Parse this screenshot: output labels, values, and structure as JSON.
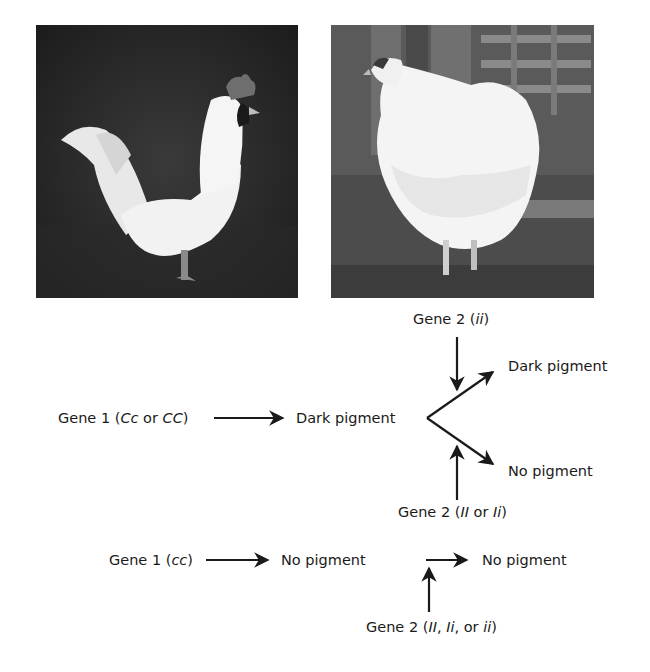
{
  "figure": {
    "photos": [
      {
        "name": "white-rooster",
        "description": "White rooster with red comb standing on dark ground"
      },
      {
        "name": "white-hen",
        "description": "Fluffy white chicken standing in front of a wooden fence"
      }
    ],
    "diagram": {
      "row1": {
        "gene1": {
          "prefix": "Gene 1 (",
          "a": "Cc",
          "mid": " or ",
          "b": "CC",
          "suffix": ")"
        },
        "intermediate": "Dark pigment",
        "gene2_top": {
          "prefix": "Gene 2 (",
          "a": "ii",
          "suffix": ")"
        },
        "gene2_bottom": {
          "prefix": "Gene 2 (",
          "a": "II",
          "mid": " or ",
          "b": "Ii",
          "suffix": ")"
        },
        "outcome_top": "Dark pigment",
        "outcome_bottom": "No pigment"
      },
      "row2": {
        "gene1": {
          "prefix": "Gene 1 (",
          "a": "cc",
          "suffix": ")"
        },
        "intermediate": "No pigment",
        "gene2": {
          "prefix": "Gene 2 (",
          "a": "II",
          "sep1": ", ",
          "b": "Ii",
          "sep2": ", or ",
          "c": "ii",
          "suffix": ")"
        },
        "outcome": "No pigment"
      }
    }
  }
}
